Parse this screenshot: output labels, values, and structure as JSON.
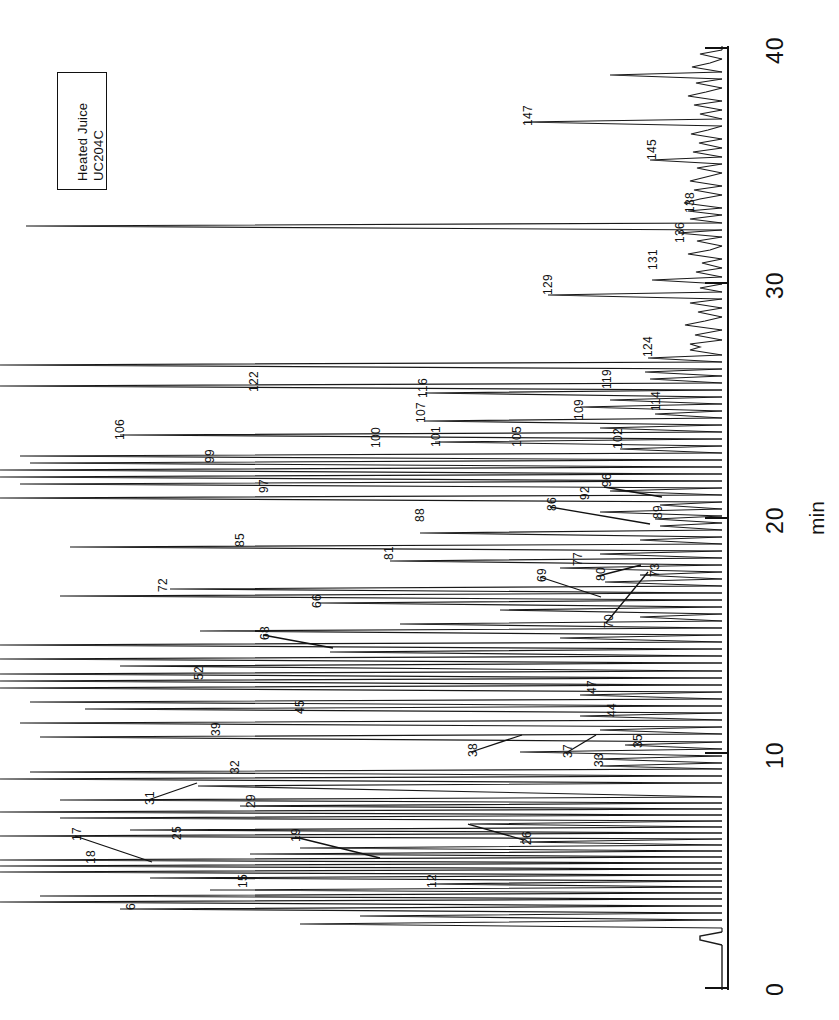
{
  "figure": {
    "caption_box": {
      "line1": "Heated Juice",
      "line2": "UC204C"
    }
  },
  "axis": {
    "title": "min",
    "ticks": [
      {
        "label": "0",
        "value": 0
      },
      {
        "label": "10",
        "value": 10
      },
      {
        "label": "20",
        "value": 20
      },
      {
        "label": "30",
        "value": 30
      },
      {
        "label": "40",
        "value": 40
      }
    ]
  },
  "chart_data": {
    "type": "line",
    "title": "Heated Juice UC204C",
    "subtitle": "",
    "xlabel": "min",
    "ylabel": "",
    "xlim": [
      0,
      40
    ],
    "ylim": [
      0,
      100
    ],
    "grid": false,
    "legend": null,
    "orientation": "rotated-90-time-axis-vertical",
    "annotations": [
      {
        "id": "6",
        "time": 3.8,
        "label": "6"
      },
      {
        "id": "12",
        "time": 4.8,
        "label": "12"
      },
      {
        "id": "15",
        "time": 5.4,
        "label": "15"
      },
      {
        "id": "17",
        "time": 6.3,
        "label": "17"
      },
      {
        "id": "18",
        "time": 6.1,
        "label": "18"
      },
      {
        "id": "19",
        "time": 6.5,
        "label": "19"
      },
      {
        "id": "25",
        "time": 7.0,
        "label": "25"
      },
      {
        "id": "26",
        "time": 6.9,
        "label": "26"
      },
      {
        "id": "29",
        "time": 7.8,
        "label": "29"
      },
      {
        "id": "31",
        "time": 8.2,
        "label": "31"
      },
      {
        "id": "32",
        "time": 8.5,
        "label": "32"
      },
      {
        "id": "33",
        "time": 9.5,
        "label": "33"
      },
      {
        "id": "35",
        "time": 9.9,
        "label": "35"
      },
      {
        "id": "37",
        "time": 9.6,
        "label": "37"
      },
      {
        "id": "38",
        "time": 9.7,
        "label": "38"
      },
      {
        "id": "39",
        "time": 10.5,
        "label": "39"
      },
      {
        "id": "44",
        "time": 10.9,
        "label": "44"
      },
      {
        "id": "45",
        "time": 11.4,
        "label": "45"
      },
      {
        "id": "47",
        "time": 11.8,
        "label": "47"
      },
      {
        "id": "52",
        "time": 12.7,
        "label": "52"
      },
      {
        "id": "66",
        "time": 15.4,
        "label": "66"
      },
      {
        "id": "68",
        "time": 14.1,
        "label": "68"
      },
      {
        "id": "69",
        "time": 16.4,
        "label": "69"
      },
      {
        "id": "70",
        "time": 16.0,
        "label": "70"
      },
      {
        "id": "72",
        "time": 15.9,
        "label": "72"
      },
      {
        "id": "73",
        "time": 16.5,
        "label": "73"
      },
      {
        "id": "77",
        "time": 17.0,
        "label": "77"
      },
      {
        "id": "80",
        "time": 16.8,
        "label": "80"
      },
      {
        "id": "81",
        "time": 17.8,
        "label": "81"
      },
      {
        "id": "85",
        "time": 18.6,
        "label": "85"
      },
      {
        "id": "86",
        "time": 19.5,
        "label": "86"
      },
      {
        "id": "88",
        "time": 19.2,
        "label": "88"
      },
      {
        "id": "89",
        "time": 19.7,
        "label": "89"
      },
      {
        "id": "92",
        "time": 20.0,
        "label": "92"
      },
      {
        "id": "96",
        "time": 20.3,
        "label": "96"
      },
      {
        "id": "97",
        "time": 21.2,
        "label": "97"
      },
      {
        "id": "99",
        "time": 21.8,
        "label": "99"
      },
      {
        "id": "100",
        "time": 22.2,
        "label": "100"
      },
      {
        "id": "101",
        "time": 22.3,
        "label": "101"
      },
      {
        "id": "102",
        "time": 22.4,
        "label": "102"
      },
      {
        "id": "105",
        "time": 22.4,
        "label": "105"
      },
      {
        "id": "106",
        "time": 22.9,
        "label": "106"
      },
      {
        "id": "107",
        "time": 23.3,
        "label": "107"
      },
      {
        "id": "109",
        "time": 23.3,
        "label": "109"
      },
      {
        "id": "114",
        "time": 23.5,
        "label": "114"
      },
      {
        "id": "116",
        "time": 23.8,
        "label": "116"
      },
      {
        "id": "119",
        "time": 24.0,
        "label": "119"
      },
      {
        "id": "122",
        "time": 24.7,
        "label": "122"
      },
      {
        "id": "124",
        "time": 25.3,
        "label": "124"
      },
      {
        "id": "129",
        "time": 29.2,
        "label": "129"
      },
      {
        "id": "131",
        "time": 29.5,
        "label": "131"
      },
      {
        "id": "136",
        "time": 31.8,
        "label": "136"
      },
      {
        "id": "138",
        "time": 32.5,
        "label": "138"
      },
      {
        "id": "145",
        "time": 35.3,
        "label": "145"
      },
      {
        "id": "147",
        "time": 36.5,
        "label": "147"
      }
    ]
  },
  "peak_labels": [
    {
      "text": "147",
      "x": 521,
      "y": 126
    },
    {
      "text": "145",
      "x": 645,
      "y": 160
    },
    {
      "text": "138",
      "x": 683,
      "y": 213
    },
    {
      "text": "136",
      "x": 673,
      "y": 243
    },
    {
      "text": "131",
      "x": 646,
      "y": 270
    },
    {
      "text": "129",
      "x": 541,
      "y": 295
    },
    {
      "text": "124",
      "x": 641,
      "y": 357
    },
    {
      "text": "122",
      "x": 247,
      "y": 392
    },
    {
      "text": "119",
      "x": 600,
      "y": 389
    },
    {
      "text": "116",
      "x": 416,
      "y": 398
    },
    {
      "text": "114",
      "x": 649,
      "y": 411
    },
    {
      "text": "107",
      "x": 414,
      "y": 423
    },
    {
      "text": "109",
      "x": 572,
      "y": 420
    },
    {
      "text": "106",
      "x": 113,
      "y": 440
    },
    {
      "text": "101",
      "x": 429,
      "y": 447
    },
    {
      "text": "100",
      "x": 369,
      "y": 448
    },
    {
      "text": "105",
      "x": 510,
      "y": 447
    },
    {
      "text": "102",
      "x": 611,
      "y": 449
    },
    {
      "text": "99",
      "x": 203,
      "y": 463
    },
    {
      "text": "96",
      "x": 600,
      "y": 487
    },
    {
      "text": "97",
      "x": 257,
      "y": 493
    },
    {
      "text": "92",
      "x": 578,
      "y": 500
    },
    {
      "text": "86",
      "x": 545,
      "y": 511
    },
    {
      "text": "89",
      "x": 651,
      "y": 519
    },
    {
      "text": "88",
      "x": 413,
      "y": 522
    },
    {
      "text": "85",
      "x": 233,
      "y": 547
    },
    {
      "text": "81",
      "x": 382,
      "y": 560
    },
    {
      "text": "77",
      "x": 571,
      "y": 566
    },
    {
      "text": "80",
      "x": 594,
      "y": 581
    },
    {
      "text": "72",
      "x": 156,
      "y": 592
    },
    {
      "text": "69",
      "x": 535,
      "y": 582
    },
    {
      "text": "73",
      "x": 648,
      "y": 577
    },
    {
      "text": "66",
      "x": 310,
      "y": 608
    },
    {
      "text": "70",
      "x": 602,
      "y": 628
    },
    {
      "text": "68",
      "x": 258,
      "y": 640
    },
    {
      "text": "52",
      "x": 192,
      "y": 680
    },
    {
      "text": "47",
      "x": 585,
      "y": 694
    },
    {
      "text": "45",
      "x": 293,
      "y": 714
    },
    {
      "text": "44",
      "x": 605,
      "y": 717
    },
    {
      "text": "39",
      "x": 209,
      "y": 736
    },
    {
      "text": "35",
      "x": 631,
      "y": 748
    },
    {
      "text": "38",
      "x": 466,
      "y": 757
    },
    {
      "text": "37",
      "x": 561,
      "y": 758
    },
    {
      "text": "33",
      "x": 592,
      "y": 767
    },
    {
      "text": "32",
      "x": 228,
      "y": 774
    },
    {
      "text": "31",
      "x": 143,
      "y": 805
    },
    {
      "text": "29",
      "x": 244,
      "y": 808
    },
    {
      "text": "25",
      "x": 170,
      "y": 840
    },
    {
      "text": "17",
      "x": 70,
      "y": 841
    },
    {
      "text": "19",
      "x": 289,
      "y": 842
    },
    {
      "text": "26",
      "x": 520,
      "y": 845
    },
    {
      "text": "18",
      "x": 84,
      "y": 864
    },
    {
      "text": "15",
      "x": 236,
      "y": 888
    },
    {
      "text": "12",
      "x": 425,
      "y": 888
    },
    {
      "text": "6",
      "x": 124,
      "y": 910
    }
  ],
  "leaders": [
    {
      "from": [
        75,
        836
      ],
      "to": [
        152,
        862
      ]
    },
    {
      "from": [
        295,
        837
      ],
      "to": [
        380,
        858
      ]
    },
    {
      "from": [
        524,
        840
      ],
      "to": [
        468,
        824
      ]
    },
    {
      "from": [
        148,
        800
      ],
      "to": [
        197,
        783
      ]
    },
    {
      "from": [
        471,
        752
      ],
      "to": [
        522,
        735
      ]
    },
    {
      "from": [
        566,
        753
      ],
      "to": [
        596,
        735
      ]
    },
    {
      "from": [
        263,
        635
      ],
      "to": [
        333,
        648
      ]
    },
    {
      "from": [
        540,
        577
      ],
      "to": [
        601,
        597
      ]
    },
    {
      "from": [
        606,
        623
      ],
      "to": [
        648,
        572
      ]
    },
    {
      "from": [
        598,
        576
      ],
      "to": [
        641,
        565
      ]
    },
    {
      "from": [
        604,
        487
      ],
      "to": [
        662,
        497
      ]
    },
    {
      "from": [
        550,
        507
      ],
      "to": [
        650,
        524
      ]
    }
  ]
}
